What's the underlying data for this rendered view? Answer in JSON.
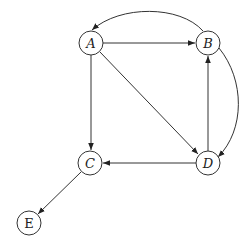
{
  "diagram": {
    "type": "directed-graph",
    "nodes": [
      {
        "id": "A",
        "label": "A",
        "x": 91,
        "y": 43,
        "italic": true
      },
      {
        "id": "B",
        "label": "B",
        "x": 208,
        "y": 43,
        "italic": true
      },
      {
        "id": "C",
        "label": "C",
        "x": 90,
        "y": 163,
        "italic": true
      },
      {
        "id": "D",
        "label": "D",
        "x": 208,
        "y": 163,
        "italic": true
      },
      {
        "id": "E",
        "label": "E",
        "x": 29,
        "y": 223,
        "italic": false
      }
    ],
    "edges": [
      {
        "from": "A",
        "to": "B",
        "style": "straight"
      },
      {
        "from": "A",
        "to": "C",
        "style": "straight"
      },
      {
        "from": "A",
        "to": "D",
        "style": "straight"
      },
      {
        "from": "D",
        "to": "B",
        "style": "straight"
      },
      {
        "from": "D",
        "to": "C",
        "style": "straight"
      },
      {
        "from": "C",
        "to": "E",
        "style": "straight"
      },
      {
        "from": "B",
        "to": "A",
        "style": "curved-top"
      },
      {
        "from": "B",
        "to": "D",
        "style": "curved-right"
      }
    ]
  }
}
